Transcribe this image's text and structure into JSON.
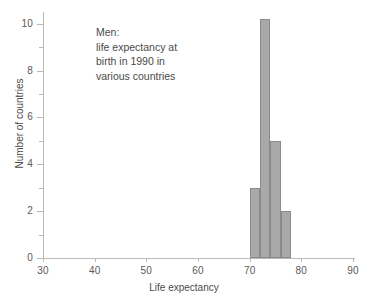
{
  "chart_data": {
    "type": "bar",
    "title": "",
    "subtitle": "",
    "xlabel": "Life expectancy",
    "ylabel": "Number of countries",
    "xlim": [
      30,
      90
    ],
    "ylim": [
      0,
      10.5
    ],
    "grid": false,
    "legend": null,
    "bin_width": 2,
    "categories": [
      "70-72",
      "72-74",
      "74-76",
      "76-78"
    ],
    "bin_edges": [
      70,
      72,
      74,
      76,
      78
    ],
    "values": [
      3,
      10.2,
      5,
      2
    ],
    "x_ticks": [
      30,
      40,
      50,
      60,
      70,
      80,
      90
    ],
    "x_tick_labels": [
      "30",
      "40",
      "50",
      "60",
      "70",
      "80",
      "90"
    ],
    "y_ticks_major": [
      0,
      2,
      4,
      6,
      8,
      10
    ],
    "y_tick_labels": [
      "0",
      "2",
      "4",
      "6",
      "8",
      "10"
    ],
    "y_ticks_minor": [
      1,
      3,
      5,
      7,
      9
    ],
    "bar_color": "#a9a9a9",
    "bar_edge_color": "#8a8a8a",
    "axis_color": "#b9b9b9",
    "text_color": "#4a4a4a",
    "annotation_lines": [
      "Men:",
      "life expectancy at",
      "birth in 1990 in",
      "various countries"
    ]
  }
}
